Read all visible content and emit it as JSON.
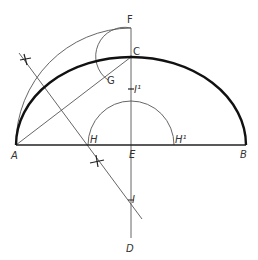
{
  "diagram": {
    "title": "",
    "points": {
      "A": {
        "label": "A",
        "italic": true
      },
      "B": {
        "label": "B",
        "italic": true
      },
      "C": {
        "label": "C",
        "italic": false
      },
      "D": {
        "label": "D",
        "italic": true
      },
      "E": {
        "label": "E",
        "italic": true
      },
      "F": {
        "label": "F",
        "italic": false
      },
      "G": {
        "label": "G",
        "italic": false
      },
      "H": {
        "label": "H",
        "italic": true
      },
      "H1": {
        "label": "H¹",
        "italic": true
      },
      "I": {
        "label": "I",
        "italic": true
      },
      "I1": {
        "label": "I¹",
        "italic": true
      }
    },
    "colors": {
      "thick_curve": "#111111",
      "construction": "#555555",
      "background": "#ffffff"
    }
  }
}
